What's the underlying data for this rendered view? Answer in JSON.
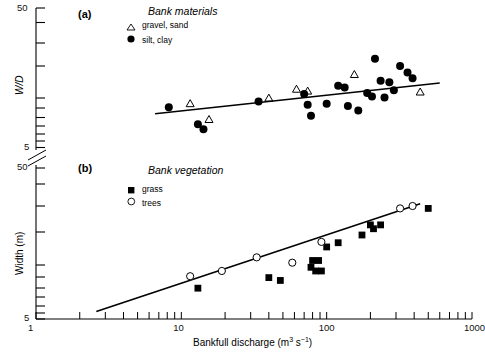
{
  "figure": {
    "xaxis": {
      "label": "Bankfull discharge (m",
      "label_sup": "3",
      "label_mid": " s",
      "label_sup2": "−1",
      "label_end": ")",
      "scale": "log",
      "range": [
        1,
        1000
      ],
      "ticklabels": [
        "1",
        "10",
        "100",
        "1000"
      ],
      "tickvalues": [
        1,
        10,
        100,
        1000
      ]
    },
    "panels": [
      {
        "id": "a",
        "tag": "(a)",
        "ylabel": "W/D",
        "yscale": "log",
        "yrange": [
          5,
          50
        ],
        "yticklabels": [
          "50",
          "5"
        ],
        "ytickvalues": [
          50,
          5
        ],
        "legend": {
          "title": "Bank materials",
          "entries": [
            {
              "marker": "open-triangle",
              "label": "gravel, sand"
            },
            {
              "marker": "filled-circle",
              "label": "silt, clay"
            }
          ]
        }
      },
      {
        "id": "b",
        "tag": "(b)",
        "ylabel": "Width (m)",
        "yscale": "log",
        "yrange": [
          5,
          50
        ],
        "yticklabels": [
          "50",
          "5"
        ],
        "ytickvalues": [
          50,
          5
        ],
        "legend": {
          "title": "Bank vegetation",
          "entries": [
            {
              "marker": "filled-square",
              "label": "grass"
            },
            {
              "marker": "open-circle",
              "label": "trees"
            }
          ]
        }
      }
    ]
  },
  "chart_data": {
    "type": "scatter",
    "title": "",
    "xlabel": "Bankfull discharge (m3 s-1)",
    "xscale": "log",
    "xlim": [
      1,
      1000
    ],
    "subplots": [
      {
        "panel": "a",
        "tag": "(a)",
        "ylabel": "W/D",
        "yscale": "log",
        "ylim": [
          5,
          50
        ],
        "legend_title": "Bank materials",
        "series": [
          {
            "name": "gravel, sand",
            "marker": "open-triangle",
            "points": [
              {
                "x": 11.5,
                "y": 10.6
              },
              {
                "x": 15.5,
                "y": 8.2
              },
              {
                "x": 40,
                "y": 11.6
              },
              {
                "x": 62,
                "y": 13.4
              },
              {
                "x": 74,
                "y": 13.0
              },
              {
                "x": 155,
                "y": 17.0
              },
              {
                "x": 440,
                "y": 12.8
              }
            ]
          },
          {
            "name": "silt, clay",
            "marker": "filled-circle",
            "points": [
              {
                "x": 8.2,
                "y": 10.0
              },
              {
                "x": 13.0,
                "y": 7.6
              },
              {
                "x": 14.2,
                "y": 7.0
              },
              {
                "x": 34,
                "y": 11.0
              },
              {
                "x": 70,
                "y": 12.4
              },
              {
                "x": 74,
                "y": 10.4
              },
              {
                "x": 78,
                "y": 8.7
              },
              {
                "x": 100,
                "y": 10.6
              },
              {
                "x": 120,
                "y": 14.2
              },
              {
                "x": 133,
                "y": 13.8
              },
              {
                "x": 140,
                "y": 10.2
              },
              {
                "x": 165,
                "y": 9.5
              },
              {
                "x": 190,
                "y": 12.6
              },
              {
                "x": 205,
                "y": 11.9
              },
              {
                "x": 215,
                "y": 22.0
              },
              {
                "x": 235,
                "y": 15.4
              },
              {
                "x": 250,
                "y": 11.7
              },
              {
                "x": 270,
                "y": 15.0
              },
              {
                "x": 290,
                "y": 13.2
              },
              {
                "x": 320,
                "y": 19.5
              },
              {
                "x": 360,
                "y": 17.6
              },
              {
                "x": 390,
                "y": 16.0
              }
            ]
          }
        ],
        "trendline": {
          "x1": 6.6,
          "y1": 9.0,
          "x2": 600,
          "y2": 14.8
        }
      },
      {
        "panel": "b",
        "tag": "(b)",
        "ylabel": "Width (m)",
        "yscale": "log",
        "ylim": [
          5,
          50
        ],
        "legend_title": "Bank vegetation",
        "series": [
          {
            "name": "grass",
            "marker": "filled-square",
            "points": [
              {
                "x": 13.0,
                "y": 8.0
              },
              {
                "x": 40,
                "y": 9.4
              },
              {
                "x": 48,
                "y": 9.0
              },
              {
                "x": 78,
                "y": 11.0
              },
              {
                "x": 80,
                "y": 12.2
              },
              {
                "x": 84,
                "y": 10.4
              },
              {
                "x": 88,
                "y": 12.2
              },
              {
                "x": 92,
                "y": 10.4
              },
              {
                "x": 100,
                "y": 15.0
              },
              {
                "x": 120,
                "y": 16.0
              },
              {
                "x": 175,
                "y": 18.0
              },
              {
                "x": 200,
                "y": 21.0
              },
              {
                "x": 210,
                "y": 19.8
              },
              {
                "x": 235,
                "y": 21.0
              },
              {
                "x": 500,
                "y": 27.0
              }
            ]
          },
          {
            "name": "trees",
            "marker": "open-circle",
            "points": [
              {
                "x": 11.5,
                "y": 9.6
              },
              {
                "x": 19.0,
                "y": 10.4
              },
              {
                "x": 33,
                "y": 12.8
              },
              {
                "x": 58,
                "y": 11.8
              },
              {
                "x": 92,
                "y": 16.2
              },
              {
                "x": 320,
                "y": 27.0
              },
              {
                "x": 390,
                "y": 28.0
              }
            ]
          }
        ],
        "trendline": {
          "x1": 2.6,
          "y1": 5.6,
          "x2": 440,
          "y2": 29.0
        }
      }
    ]
  }
}
